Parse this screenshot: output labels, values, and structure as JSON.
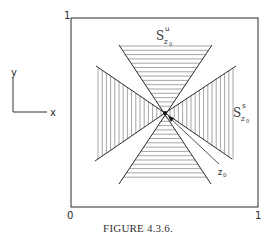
{
  "figure": {
    "caption": "FIGURE 4.3.6.",
    "corner_labels": {
      "top_left": "1",
      "bottom_left": "0",
      "bottom_right": "1"
    },
    "axis_indicator": {
      "x_label": "x",
      "y_label": "y"
    },
    "regions": [
      {
        "id": "unstable",
        "label_main": "S",
        "label_sup": "u",
        "label_sub": "z",
        "label_subsub": "0",
        "orientation": "vertical",
        "hatch": "horizontal"
      },
      {
        "id": "stable",
        "label_main": "S",
        "label_sup": "s",
        "label_sub": "z",
        "label_subsub": "0",
        "orientation": "horizontal",
        "hatch": "vertical"
      }
    ],
    "point": {
      "label": "z",
      "label_sub": "0"
    },
    "colors": {
      "line": "#2a2a2a",
      "hatch": "#6a6a6a"
    }
  }
}
